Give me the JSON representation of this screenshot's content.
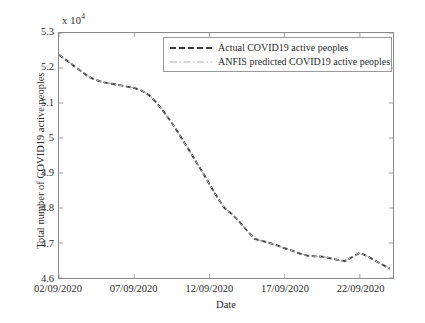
{
  "chart_data": {
    "type": "line",
    "title": "",
    "xlabel": "Date",
    "ylabel": "Total number of COVID19 active peoples",
    "y_exponent_label": "x 10",
    "y_exponent_power": "4",
    "y_scale": 10000,
    "ylim": [
      4.6,
      5.3
    ],
    "ytick_labels": [
      "4.6",
      "4.7",
      "4.8",
      "4.9",
      "5",
      "5.1",
      "5.2",
      "5.3"
    ],
    "ytick_values": [
      4.6,
      4.7,
      4.8,
      4.9,
      5.0,
      5.1,
      5.2,
      5.3
    ],
    "xlim": [
      1,
      23.2
    ],
    "xtick_labels": [
      "02/09/2020",
      "07/09/2020",
      "12/09/2020",
      "17/09/2020",
      "22/09/2020"
    ],
    "xtick_values": [
      1,
      6,
      11,
      16,
      21
    ],
    "grid": false,
    "legend_position": "top-center",
    "x": [
      1,
      1.5,
      2,
      2.5,
      3,
      3.5,
      4,
      4.5,
      5,
      5.5,
      6,
      6.5,
      7,
      7.5,
      8,
      8.5,
      9,
      9.5,
      10,
      10.5,
      11,
      11.5,
      12,
      12.5,
      13,
      13.5,
      14,
      14.5,
      15,
      15.5,
      16,
      16.5,
      17,
      17.5,
      18,
      18.5,
      19,
      19.5,
      20,
      20.5,
      21,
      21.5,
      22,
      22.5,
      23
    ],
    "series": [
      {
        "name": "Actual COVID19 active peoples",
        "style": "dashed",
        "color": "#3a3a3a",
        "width": 1.9,
        "values": [
          5.238,
          5.222,
          5.206,
          5.19,
          5.174,
          5.165,
          5.159,
          5.155,
          5.151,
          5.147,
          5.143,
          5.135,
          5.122,
          5.1,
          5.073,
          5.043,
          5.01,
          4.975,
          4.94,
          4.905,
          4.868,
          4.832,
          4.8,
          4.782,
          4.76,
          4.735,
          4.712,
          4.706,
          4.7,
          4.693,
          4.685,
          4.678,
          4.67,
          4.664,
          4.662,
          4.661,
          4.657,
          4.652,
          4.648,
          4.66,
          4.672,
          4.662,
          4.65,
          4.638,
          4.627
        ]
      },
      {
        "name": "ANFIS predicted COVID19 active peoples",
        "style": "dash-dot",
        "color": "#b0b0b0",
        "width": 1.0,
        "values": [
          5.238,
          5.222,
          5.206,
          5.19,
          5.174,
          5.165,
          5.159,
          5.155,
          5.151,
          5.147,
          5.143,
          5.135,
          5.122,
          5.1,
          5.073,
          5.043,
          5.01,
          4.975,
          4.94,
          4.905,
          4.868,
          4.832,
          4.8,
          4.782,
          4.76,
          4.735,
          4.712,
          4.706,
          4.7,
          4.693,
          4.685,
          4.678,
          4.67,
          4.664,
          4.662,
          4.661,
          4.657,
          4.652,
          4.648,
          4.66,
          4.672,
          4.662,
          4.65,
          4.638,
          4.627
        ]
      }
    ]
  },
  "legend": {
    "items": [
      {
        "label": "Actual COVID19 active peoples"
      },
      {
        "label": "ANFIS predicted COVID19 active peoples"
      }
    ]
  },
  "axes": {
    "x_title": "Date",
    "y_title": "Total number of COVID19 active peoples"
  },
  "colors": {
    "actual": "#3a3a3a",
    "predicted": "#b0b0b0",
    "axis": "#8a8a8a",
    "background": "#ffffff"
  }
}
